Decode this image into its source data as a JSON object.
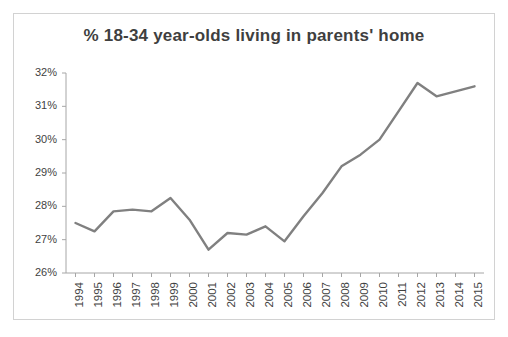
{
  "chart_data": {
    "type": "line",
    "title": "% 18-34 year-olds living in parents' home",
    "xlabel": "",
    "ylabel": "",
    "ylim": [
      26,
      32
    ],
    "ytick_step": 1,
    "ytick_labels": [
      "26%",
      "27%",
      "28%",
      "29%",
      "30%",
      "31%",
      "32%"
    ],
    "ytick_values": [
      26,
      27,
      28,
      29,
      30,
      31,
      32
    ],
    "grid": false,
    "legend": "none",
    "line_color": "#808080",
    "categories": [
      "1994",
      "1995",
      "1996",
      "1997",
      "1998",
      "1999",
      "2000",
      "2001",
      "2002",
      "2003",
      "2004",
      "2005",
      "2006",
      "2007",
      "2008",
      "2009",
      "2010",
      "2011",
      "2012",
      "2013",
      "2014",
      "2015"
    ],
    "values": [
      27.5,
      27.25,
      27.85,
      27.9,
      27.85,
      28.25,
      27.6,
      26.7,
      27.2,
      27.15,
      27.4,
      26.95,
      27.7,
      28.4,
      29.2,
      29.55,
      30.0,
      30.85,
      31.7,
      31.3,
      31.45,
      31.6
    ],
    "series": [
      {
        "name": "% 18-34 year-olds living in parents' home",
        "values": [
          27.5,
          27.25,
          27.85,
          27.9,
          27.85,
          28.25,
          27.6,
          26.7,
          27.2,
          27.15,
          27.4,
          26.95,
          27.7,
          28.4,
          29.2,
          29.55,
          30.0,
          30.85,
          31.7,
          31.3,
          31.45,
          31.6
        ]
      }
    ]
  }
}
